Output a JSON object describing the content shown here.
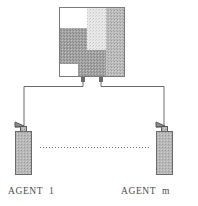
{
  "figure": {
    "type": "diagram",
    "background_color": "#ffffff",
    "line_color": "#5a5a5a",
    "text_color": "#4a4a4a"
  },
  "environment": {
    "name": "environment-grid",
    "description": "Square grid panel with shaded blocks",
    "border_color": "#7a7a7a",
    "fill_color": "#ffffff",
    "x": 59,
    "y": 7,
    "width": 66,
    "height": 70,
    "blocks": [
      {
        "name": "block-top-left-white",
        "x": 0,
        "y": 0,
        "w": 28,
        "h": 21,
        "shade": "#ffffff"
      },
      {
        "name": "block-top-mid-light",
        "x": 28,
        "y": 0,
        "w": 19,
        "h": 21,
        "shade": "#d8d8d8"
      },
      {
        "name": "block-top-right-mid",
        "x": 47,
        "y": 0,
        "w": 19,
        "h": 21,
        "shade": "#a8a8a8"
      },
      {
        "name": "block-mid-left-dark",
        "x": 0,
        "y": 21,
        "w": 28,
        "h": 22,
        "shade": "#909090"
      },
      {
        "name": "block-mid-center-light",
        "x": 28,
        "y": 21,
        "w": 19,
        "h": 22,
        "shade": "#e4e4e4"
      },
      {
        "name": "block-mid-right-mid",
        "x": 47,
        "y": 21,
        "w": 19,
        "h": 22,
        "shade": "#a8a8a8"
      },
      {
        "name": "block-bot-left-dark",
        "x": 0,
        "y": 43,
        "w": 19,
        "h": 14,
        "shade": "#909090"
      },
      {
        "name": "block-bot-left-white",
        "x": 0,
        "y": 57,
        "w": 19,
        "h": 13,
        "shade": "#ffffff"
      },
      {
        "name": "block-bot-mid-dark",
        "x": 19,
        "y": 43,
        "w": 28,
        "h": 27,
        "shade": "#9a9a9a"
      },
      {
        "name": "block-bot-right-mid",
        "x": 47,
        "y": 43,
        "w": 19,
        "h": 27,
        "shade": "#a8a8a8"
      }
    ]
  },
  "connectors": {
    "name": "connector-wires",
    "left_port": {
      "x": 81,
      "y": 77,
      "w": 4,
      "h": 5
    },
    "right_port": {
      "x": 99,
      "y": 77,
      "w": 4,
      "h": 5
    },
    "left_wire_points": "83,82 83,86 24,86 24,125",
    "right_wire_points": "101,82 101,86 164,86 164,125"
  },
  "agents": [
    {
      "id": "agent-1",
      "label": "AGENT  1",
      "name": "agent-1",
      "body": {
        "x": 15,
        "y": 131,
        "w": 16,
        "h": 44,
        "fill": "#b0b0b0",
        "border": "#6a6a6a"
      },
      "neck": {
        "x": 20,
        "y": 125,
        "w": 6,
        "h": 6
      },
      "nozzle_direction": "left"
    },
    {
      "id": "agent-m",
      "label": "AGENT  m",
      "name": "agent-m",
      "body": {
        "x": 156,
        "y": 131,
        "w": 16,
        "h": 44,
        "fill": "#b0b0b0",
        "border": "#6a6a6a"
      },
      "neck": {
        "x": 161,
        "y": 125,
        "w": 6,
        "h": 6
      },
      "nozzle_direction": "left"
    }
  ],
  "ellipsis": {
    "name": "agents-ellipsis-dotted-line",
    "description": "Dotted line indicating additional agents between agent 1 and agent m",
    "x1": 40,
    "x2": 150,
    "y": 147,
    "color": "#707070",
    "dash": "1,2"
  }
}
